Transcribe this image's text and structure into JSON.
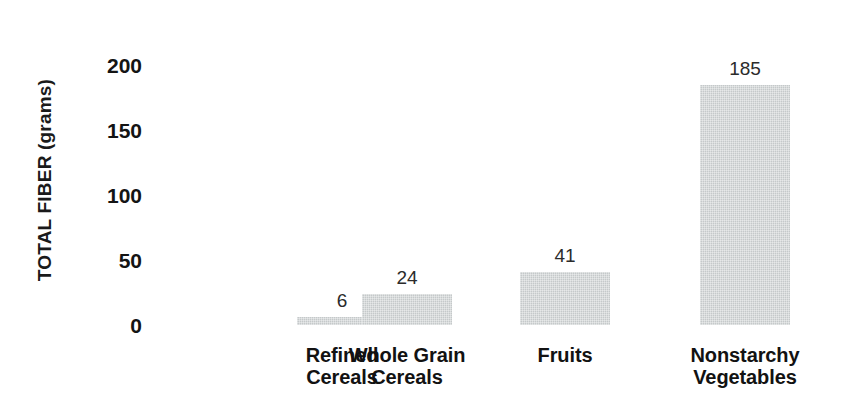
{
  "chart_data": {
    "type": "bar",
    "title": "",
    "xlabel": "",
    "ylabel": "TOTAL FIBER (grams)",
    "ylim": [
      0,
      200
    ],
    "ytick_labels": [
      "200",
      "150",
      "100",
      "50",
      "0"
    ],
    "ytick_values": [
      200,
      150,
      100,
      50,
      0
    ],
    "grid": false,
    "legend": false,
    "categories": [
      "Refined Cereals",
      "Whole Grain Cereals",
      "Fruits",
      "Nonstarchy Vegetables"
    ],
    "values": [
      6,
      24,
      41,
      185
    ],
    "value_labels": [
      "6",
      "24",
      "41",
      "185"
    ],
    "bar_color": "#c9cdce",
    "text_color": "#121212"
  },
  "bars": [
    {
      "label_line1": "Refined",
      "label_line2": "Cereals",
      "label": "Refined\nCereals",
      "value": 6,
      "value_label": "6"
    },
    {
      "label_line1": "Whole Grain",
      "label_line2": "Cereals",
      "label": "Whole Grain\nCereals",
      "value": 24,
      "value_label": "24"
    },
    {
      "label_line1": "Fruits",
      "label_line2": "",
      "label": "Fruits",
      "value": 41,
      "value_label": "41"
    },
    {
      "label_line1": "Nonstarchy",
      "label_line2": "Vegetables",
      "label": "Nonstarchy\nVegetables",
      "value": 185,
      "value_label": "185"
    }
  ],
  "y_axis": {
    "title": "TOTAL FIBER (grams)",
    "ticks": [
      "200",
      "150",
      "100",
      "50",
      "0"
    ]
  }
}
